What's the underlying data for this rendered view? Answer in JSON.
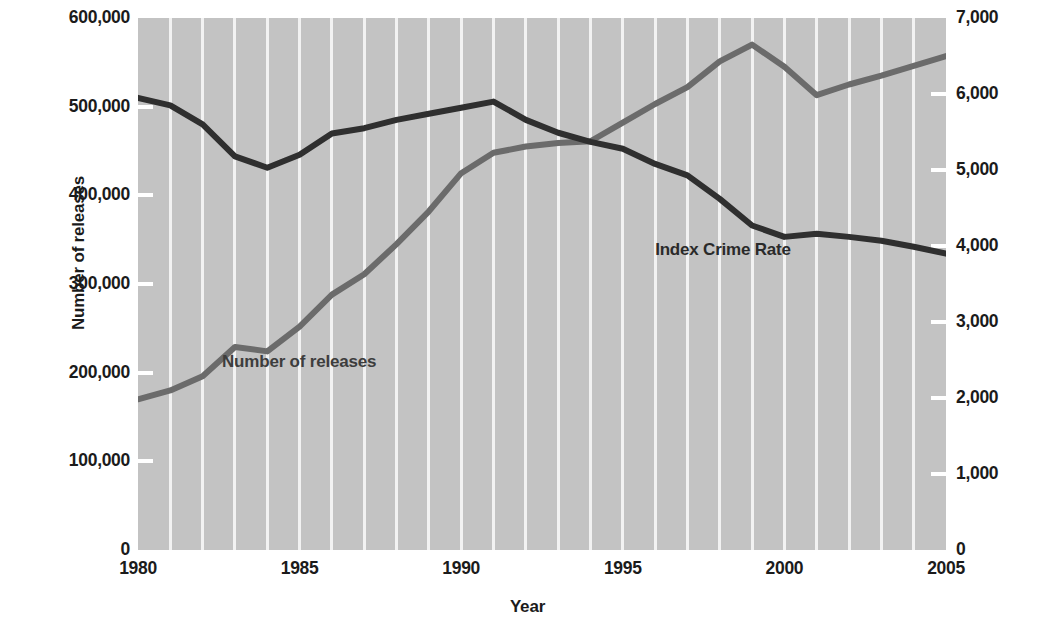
{
  "chart_data": {
    "type": "line",
    "title": "",
    "xlabel": "Year",
    "ylabel": "Number of releases",
    "ylabel_right": "Index crimes per 100,000 population",
    "xlim": [
      1980,
      2005
    ],
    "ylim": [
      0,
      600000
    ],
    "ylim_right": [
      0,
      7000
    ],
    "grid": true,
    "grid_orientation": "vertical",
    "legend_position": "inline-annotation",
    "x_ticks": [
      1980,
      1985,
      1990,
      1995,
      2000,
      2005
    ],
    "x_tick_labels": [
      "1980",
      "1985",
      "1990",
      "1995",
      "2000",
      "2005"
    ],
    "y_ticks_left": [
      0,
      100000,
      200000,
      300000,
      400000,
      500000,
      600000
    ],
    "y_tick_labels_left": [
      "0",
      "100,000",
      "200,000",
      "300,000",
      "400,000",
      "500,000",
      "600,000"
    ],
    "y_ticks_right": [
      0,
      1000,
      2000,
      3000,
      4000,
      5000,
      6000,
      7000
    ],
    "y_tick_labels_right": [
      "0",
      "1,000",
      "2,000",
      "3,000",
      "4,000",
      "5,000",
      "6,000",
      "7,000"
    ],
    "x": [
      1980,
      1981,
      1982,
      1983,
      1984,
      1985,
      1986,
      1987,
      1988,
      1989,
      1990,
      1991,
      1992,
      1993,
      1994,
      1995,
      1996,
      1997,
      1998,
      1999,
      2000,
      2001,
      2002,
      2003,
      2004,
      2005
    ],
    "series": [
      {
        "name": "Number of releases",
        "axis": "left",
        "color": "#6b6b6b",
        "label_x": 1982.6,
        "label_y": 212000,
        "values": [
          170000,
          180000,
          196000,
          229000,
          224000,
          252000,
          288000,
          311000,
          345000,
          382000,
          425000,
          448000,
          455000,
          459000,
          461000,
          482000,
          503000,
          522000,
          551000,
          570000,
          545000,
          513000,
          525000,
          535000,
          546000,
          557000
        ]
      },
      {
        "name": "Index Crime Rate",
        "axis": "right",
        "color": "#2f2f2f",
        "label_x": 1998.1,
        "label_y": 3950,
        "values": [
          5950,
          5850,
          5600,
          5180,
          5030,
          5200,
          5480,
          5550,
          5660,
          5740,
          5820,
          5900,
          5660,
          5490,
          5370,
          5280,
          5080,
          4930,
          4620,
          4270,
          4120,
          4160,
          4120,
          4070,
          3990,
          3900
        ]
      }
    ]
  },
  "axes": {
    "left_title": "Number of releases",
    "right_title": "Index crimes per 100,000 population",
    "x_title": "Year"
  },
  "annotations": {
    "releases_label": "Number of releases",
    "crime_label": "Index Crime Rate"
  },
  "colors": {
    "plot_background": "#c3c3c3",
    "gridline": "#f2f2f2",
    "releases_line": "#6b6b6b",
    "crime_line": "#2f2f2f",
    "text": "#1b1b1b"
  }
}
